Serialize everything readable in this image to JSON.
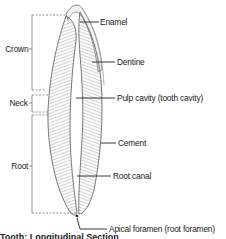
{
  "diagram": {
    "regions": [
      {
        "label": "Crown",
        "y_top": 15,
        "y_bottom": 90
      },
      {
        "label": "Neck",
        "y_top": 95,
        "y_bottom": 112
      },
      {
        "label": "Root",
        "y_top": 115,
        "y_bottom": 213
      }
    ],
    "labels": [
      {
        "text": "Enamel"
      },
      {
        "text": "Dentine"
      },
      {
        "text": "Pulp cavity (tooth cavity)"
      },
      {
        "text": "Cement"
      },
      {
        "text": "Root canal"
      },
      {
        "text": "Apical foramen (root foramen)"
      }
    ],
    "caption": "Tooth: Longitudinal Section"
  },
  "colors": {
    "line": "#222222",
    "bracket": "#555555",
    "tooth_fill": "#e8e8e8",
    "tooth_hatch": "#777777"
  }
}
